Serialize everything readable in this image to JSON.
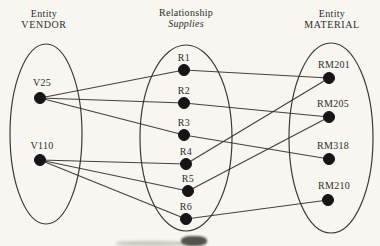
{
  "figure": {
    "background": "#f7f6f1",
    "ink": "#35332f",
    "columns": [
      {
        "id": "vendor",
        "cx": 44,
        "line1": "Entity",
        "line2": "VENDOR",
        "line2_italic": false
      },
      {
        "id": "supplies",
        "cx": 186,
        "line1": "Relationship",
        "line2": "Supplies",
        "line2_italic": true
      },
      {
        "id": "material",
        "cx": 332,
        "line1": "Entity",
        "line2": "MATERIAL",
        "line2_italic": false
      }
    ],
    "ellipses": [
      {
        "id": "vendor-ellipse",
        "cx": 46,
        "cy": 134,
        "rx": 36,
        "ry": 90
      },
      {
        "id": "supplies-ellipse",
        "cx": 186,
        "cy": 138,
        "rx": 46,
        "ry": 93
      },
      {
        "id": "material-ellipse",
        "cx": 331,
        "cy": 138,
        "rx": 42,
        "ry": 95
      }
    ],
    "nodes": [
      {
        "id": "V25",
        "x": 40,
        "y": 98,
        "label": "V25",
        "ldx": 2,
        "ldy": -12
      },
      {
        "id": "V110",
        "x": 40,
        "y": 160,
        "label": "V110",
        "ldx": 2,
        "ldy": -11
      },
      {
        "id": "R1",
        "x": 184,
        "y": 70,
        "label": "R1",
        "ldx": 0,
        "ldy": -9
      },
      {
        "id": "R2",
        "x": 184,
        "y": 103,
        "label": "R2",
        "ldx": 0,
        "ldy": -9
      },
      {
        "id": "R3",
        "x": 184,
        "y": 135,
        "label": "R3",
        "ldx": 0,
        "ldy": -9
      },
      {
        "id": "R4",
        "x": 186,
        "y": 164,
        "label": "R4",
        "ldx": 0,
        "ldy": -9
      },
      {
        "id": "R5",
        "x": 188,
        "y": 191,
        "label": "R5",
        "ldx": 0,
        "ldy": -9
      },
      {
        "id": "R6",
        "x": 186,
        "y": 219,
        "label": "R6",
        "ldx": 0,
        "ldy": -9
      },
      {
        "id": "RM201",
        "x": 329,
        "y": 78,
        "label": "RM201",
        "ldx": 5,
        "ldy": -10
      },
      {
        "id": "RM205",
        "x": 329,
        "y": 117,
        "label": "RM205",
        "ldx": 4,
        "ldy": -10
      },
      {
        "id": "RM318",
        "x": 329,
        "y": 159,
        "label": "RM318",
        "ldx": 4,
        "ldy": -10
      },
      {
        "id": "RM210",
        "x": 328,
        "y": 200,
        "label": "RM210",
        "ldx": 6,
        "ldy": -11
      }
    ],
    "edges": [
      [
        "V25",
        "R1"
      ],
      [
        "V25",
        "R2"
      ],
      [
        "V25",
        "R3"
      ],
      [
        "V110",
        "R4"
      ],
      [
        "V110",
        "R5"
      ],
      [
        "V110",
        "R6"
      ],
      [
        "R1",
        "RM201"
      ],
      [
        "R2",
        "RM205"
      ],
      [
        "R3",
        "RM318"
      ],
      [
        "R4",
        "RM201"
      ],
      [
        "R5",
        "RM205"
      ],
      [
        "R6",
        "RM210"
      ]
    ],
    "dot_radius": 5.5
  }
}
